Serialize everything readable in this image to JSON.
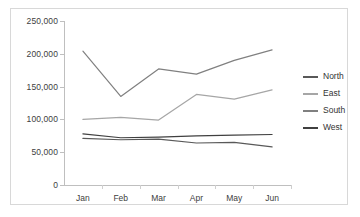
{
  "chart_data": {
    "type": "line",
    "title": "",
    "xlabel": "",
    "ylabel": "",
    "categories": [
      "Jan",
      "Feb",
      "Mar",
      "Apr",
      "May",
      "Jun"
    ],
    "ylim": [
      0,
      250000
    ],
    "ytick_values": [
      0,
      50000,
      100000,
      150000,
      200000,
      250000
    ],
    "ytick_labels": [
      "0",
      "50,000",
      "100,000",
      "150,000",
      "200,000",
      "250,000"
    ],
    "grid": false,
    "legend_position": "right",
    "series": [
      {
        "name": "North",
        "color": "#595959",
        "values": [
          71000,
          69000,
          70000,
          64000,
          65000,
          58000
        ]
      },
      {
        "name": "East",
        "color": "#a6a6a6",
        "values": [
          100000,
          103000,
          99000,
          138000,
          131000,
          145000
        ]
      },
      {
        "name": "South",
        "color": "#808080",
        "values": [
          204000,
          135000,
          177000,
          169000,
          190000,
          206000
        ]
      },
      {
        "name": "West",
        "color": "#404040",
        "values": [
          78000,
          72000,
          73000,
          75000,
          76000,
          77000
        ]
      }
    ]
  },
  "legend": {
    "items": [
      {
        "label": "North"
      },
      {
        "label": "East"
      },
      {
        "label": "South"
      },
      {
        "label": "West"
      }
    ]
  }
}
